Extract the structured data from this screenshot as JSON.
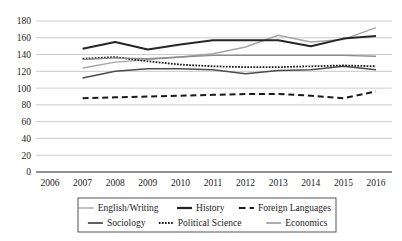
{
  "chart_data": {
    "type": "line",
    "title": "",
    "xlabel": "",
    "ylabel": "",
    "x": [
      2006,
      2007,
      2008,
      2009,
      2010,
      2011,
      2012,
      2013,
      2014,
      2015,
      2016
    ],
    "categories": [
      "2006",
      "2007",
      "2008",
      "2009",
      "2010",
      "2011",
      "2012",
      "2013",
      "2014",
      "2015",
      "2016"
    ],
    "ylim": [
      0,
      180
    ],
    "yticks": [
      0,
      20,
      40,
      60,
      80,
      100,
      120,
      140,
      160,
      180
    ],
    "ytick_labels": [
      "0",
      "20",
      "40",
      "60",
      "80",
      "100",
      "120",
      "140",
      "160",
      "180"
    ],
    "grid": true,
    "grid_axis": "y",
    "legend_position": "bottom",
    "legend_columns": 3,
    "series": [
      {
        "name": "English/Writing",
        "color": "#a6a6a6",
        "style": "solid",
        "width": 1.4,
        "x": [
          2007,
          2008,
          2009,
          2010,
          2011,
          2012,
          2013,
          2014,
          2015,
          2016
        ],
        "values": [
          124,
          131,
          134,
          137,
          141,
          149,
          163,
          155,
          158,
          172
        ]
      },
      {
        "name": "History",
        "color": "#262626",
        "style": "solid",
        "width": 2.0,
        "x": [
          2007,
          2008,
          2009,
          2010,
          2011,
          2012,
          2013,
          2014,
          2015,
          2016
        ],
        "values": [
          147,
          155,
          146,
          152,
          157,
          157,
          157,
          150,
          159,
          162
        ]
      },
      {
        "name": "Foreign Languages",
        "color": "#1a1a1a",
        "style": "dashed",
        "width": 2.0,
        "x": [
          2007,
          2008,
          2009,
          2010,
          2011,
          2012,
          2013,
          2014,
          2015,
          2016
        ],
        "values": [
          88,
          89,
          90,
          91,
          92,
          93,
          93,
          91,
          88,
          96
        ]
      },
      {
        "name": "Sociology",
        "color": "#4d4d4d",
        "style": "solid",
        "width": 1.5,
        "x": [
          2007,
          2008,
          2009,
          2010,
          2011,
          2012,
          2013,
          2014,
          2015,
          2016
        ],
        "values": [
          112,
          120,
          123,
          123,
          122,
          117,
          121,
          122,
          126,
          122
        ]
      },
      {
        "name": "Political Science",
        "color": "#1a1a1a",
        "style": "dotted",
        "width": 1.8,
        "x": [
          2007,
          2008,
          2009,
          2010,
          2011,
          2012,
          2013,
          2014,
          2015,
          2016
        ],
        "values": [
          135,
          137,
          132,
          128,
          126,
          125,
          125,
          126,
          127,
          126
        ]
      },
      {
        "name": "Economics",
        "color": "#8c8c8c",
        "style": "solid",
        "width": 1.4,
        "x": [
          2007,
          2008,
          2009,
          2010,
          2011,
          2012,
          2013,
          2014,
          2015,
          2016
        ],
        "values": [
          134,
          136,
          135,
          137,
          139,
          139,
          139,
          139,
          139,
          138
        ]
      }
    ],
    "legend_entries": [
      {
        "label": "English/Writing",
        "color": "#a6a6a6",
        "style": "solid",
        "width": 1.4
      },
      {
        "label": "History",
        "color": "#262626",
        "style": "solid",
        "width": 2.2
      },
      {
        "label": "Foreign Languages",
        "color": "#1a1a1a",
        "style": "dashed",
        "width": 2.2
      },
      {
        "label": "Sociology",
        "color": "#4d4d4d",
        "style": "solid",
        "width": 1.8
      },
      {
        "label": "Political Science",
        "color": "#1a1a1a",
        "style": "dotted",
        "width": 1.8
      },
      {
        "label": "Economics",
        "color": "#8c8c8c",
        "style": "solid",
        "width": 1.4
      }
    ],
    "gridline_color": "#b5b5b5",
    "axis_color": "#3a3a3a"
  }
}
